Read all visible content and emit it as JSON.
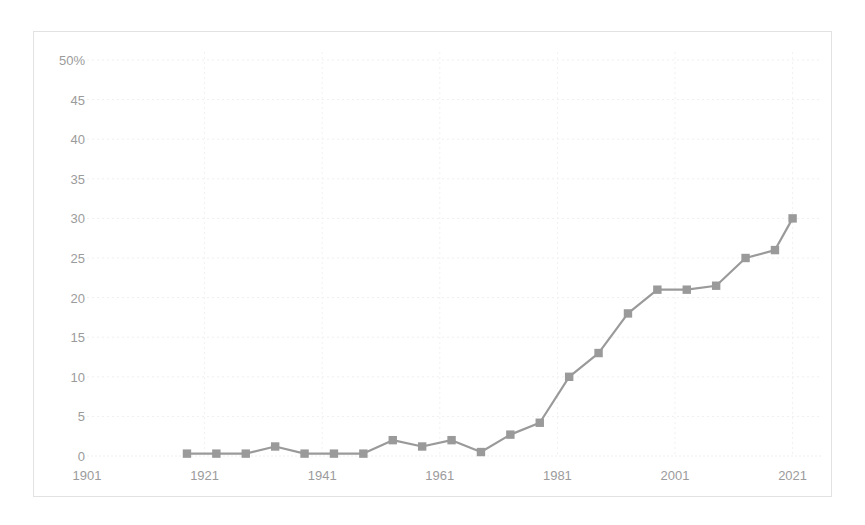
{
  "chart_data": {
    "type": "line",
    "title": "",
    "subtitle": "",
    "xlabel": "",
    "ylabel": "",
    "xlim": [
      1901,
      2026
    ],
    "ylim": [
      0,
      50
    ],
    "grid": true,
    "legend": false,
    "y_tick_labels": [
      "50%",
      "45",
      "40",
      "35",
      "30",
      "25",
      "20",
      "15",
      "10",
      "5",
      "0"
    ],
    "y_ticks": [
      50,
      45,
      40,
      35,
      30,
      25,
      20,
      15,
      10,
      5,
      0
    ],
    "x_tick_labels": [
      "1901",
      "1921",
      "1941",
      "1961",
      "1981",
      "2001",
      "2021"
    ],
    "x_ticks": [
      1901,
      1921,
      1941,
      1961,
      1981,
      2001,
      2021
    ],
    "series": [
      {
        "name": "Share",
        "color": "#9a9a9a",
        "marker": "square",
        "x": [
          1918,
          1923,
          1928,
          1933,
          1938,
          1943,
          1948,
          1953,
          1958,
          1963,
          1968,
          1973,
          1978,
          1983,
          1988,
          1993,
          1998,
          2003,
          2008,
          2013,
          2018,
          2021
        ],
        "values": [
          0.3,
          0.3,
          0.3,
          1.2,
          0.3,
          0.3,
          0.3,
          2.0,
          1.2,
          2.0,
          0.5,
          2.7,
          4.2,
          10.0,
          13.0,
          18.0,
          21.0,
          21.0,
          21.5,
          25.0,
          26.0,
          30.0
        ]
      }
    ]
  }
}
